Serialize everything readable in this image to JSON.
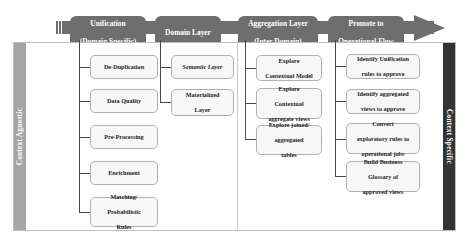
{
  "diagram": {
    "title_bar": {
      "stages": [
        {
          "id": "unification",
          "line1": "Unification",
          "line2": "(Domain Specific)"
        },
        {
          "id": "domain-layer",
          "line1": "Domain Layer",
          "line2": ""
        },
        {
          "id": "aggregation",
          "line1": "Aggregation Layer",
          "line2": "(Inter Domain)"
        },
        {
          "id": "promote",
          "line1": "Promote to",
          "line2": "Operational Flow"
        }
      ]
    },
    "side_labels": {
      "left": "Context Agnostic",
      "right": "Context Specific"
    },
    "columns": [
      {
        "id": "unification",
        "nodes": [
          {
            "lines": [
              "De-Duplication"
            ]
          },
          {
            "lines": [
              "Data Quality"
            ]
          },
          {
            "lines": [
              "Pre-Processing"
            ]
          },
          {
            "lines": [
              "Enrichment"
            ]
          },
          {
            "lines": [
              "Matching/",
              "Probabilistic",
              "Rules"
            ]
          }
        ]
      },
      {
        "id": "domain-layer",
        "nodes": [
          {
            "lines": [
              "Semantic Layer"
            ],
            "italic": true
          },
          {
            "lines": [
              "Materialized",
              "Layer"
            ]
          }
        ]
      },
      {
        "id": "aggregation",
        "nodes": [
          {
            "lines": [
              "Explore",
              "Contextual Model"
            ]
          },
          {
            "lines": [
              "Explore",
              "Contextual",
              "aggregate views"
            ]
          },
          {
            "lines": [
              "Explore joined/",
              "aggregated",
              "tables"
            ]
          }
        ]
      },
      {
        "id": "promote",
        "nodes": [
          {
            "lines": [
              "Identify Unification",
              "rules to approve"
            ]
          },
          {
            "lines": [
              "Identify aggregated",
              "views to approve"
            ]
          },
          {
            "lines": [
              "Convert",
              "exploratory rules to",
              "operational jobs"
            ]
          },
          {
            "lines": [
              "Build Business",
              "Glossary of",
              "approved views"
            ]
          }
        ]
      }
    ],
    "colors": {
      "banner": "#6e6e6e",
      "node_fill": "#f7f7f7",
      "node_border": "#b0b0b0",
      "side_left": "#a6a6a6",
      "side_right": "#333333",
      "connector": "#4a4a4a"
    }
  }
}
